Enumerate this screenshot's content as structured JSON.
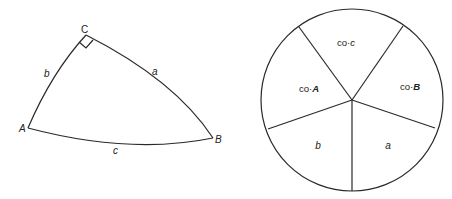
{
  "triangle": {
    "vertices": {
      "A": "A",
      "B": "B",
      "C": "C"
    },
    "sides": {
      "a": "a",
      "b": "b",
      "c": "c"
    },
    "right_angle_at": "C"
  },
  "napier_circle": {
    "segments": [
      {
        "label_prefix": "co·",
        "label_var": "c",
        "name": "co-c"
      },
      {
        "label_prefix": "co·",
        "label_var": "B",
        "name": "co-B"
      },
      {
        "label_prefix": "",
        "label_var": "a",
        "name": "a"
      },
      {
        "label_prefix": "",
        "label_var": "b",
        "name": "b"
      },
      {
        "label_prefix": "co·",
        "label_var": "A",
        "name": "co-A"
      }
    ]
  },
  "colors": {
    "stroke": "#2a2a2a",
    "background": "#ffffff"
  }
}
